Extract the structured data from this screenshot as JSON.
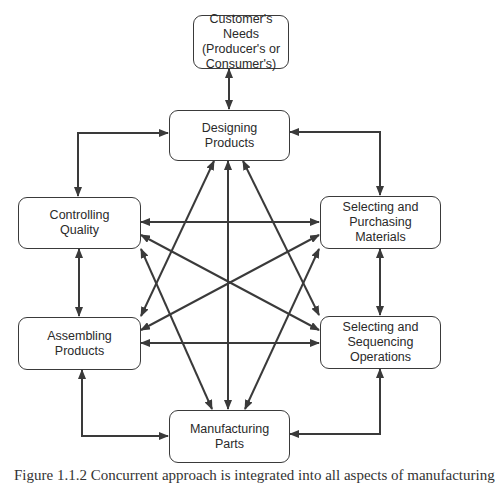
{
  "diagram": {
    "colors": {
      "line": "#3a3a3a",
      "box_border": "#3a3a3a",
      "text": "#2a2a2a",
      "background": "#ffffff"
    },
    "nodes": {
      "customers_needs": {
        "label": "Customer's Needs\n(Producer's or\nConsumer's)"
      },
      "designing_products": {
        "label": "Designing\nProducts"
      },
      "controlling_quality": {
        "label": "Controlling\nQuality"
      },
      "selecting_purchasing": {
        "label": "Selecting and\nPurchasing\nMaterials"
      },
      "assembling_products": {
        "label": "Assembling\nProducts"
      },
      "selecting_sequencing": {
        "label": "Selecting and\nSequencing\nOperations"
      },
      "manufacturing_parts": {
        "label": "Manufacturing\nParts"
      }
    },
    "edges": [
      {
        "from": "customers_needs",
        "to": "designing_products",
        "type": "bidirectional"
      },
      {
        "from": "designing_products",
        "to": "controlling_quality",
        "type": "bidirectional-elbow"
      },
      {
        "from": "designing_products",
        "to": "selecting_purchasing",
        "type": "bidirectional-elbow"
      },
      {
        "from": "designing_products",
        "to": "assembling_products",
        "type": "bidirectional"
      },
      {
        "from": "designing_products",
        "to": "manufacturing_parts",
        "type": "bidirectional"
      },
      {
        "from": "designing_products",
        "to": "selecting_sequencing",
        "type": "bidirectional"
      },
      {
        "from": "controlling_quality",
        "to": "selecting_purchasing",
        "type": "bidirectional"
      },
      {
        "from": "controlling_quality",
        "to": "selecting_sequencing",
        "type": "bidirectional"
      },
      {
        "from": "controlling_quality",
        "to": "manufacturing_parts",
        "type": "bidirectional"
      },
      {
        "from": "controlling_quality",
        "to": "assembling_products",
        "type": "bidirectional"
      },
      {
        "from": "selecting_purchasing",
        "to": "assembling_products",
        "type": "bidirectional"
      },
      {
        "from": "selecting_purchasing",
        "to": "manufacturing_parts",
        "type": "bidirectional"
      },
      {
        "from": "selecting_purchasing",
        "to": "selecting_sequencing",
        "type": "bidirectional"
      },
      {
        "from": "assembling_products",
        "to": "selecting_sequencing",
        "type": "bidirectional"
      },
      {
        "from": "assembling_products",
        "to": "manufacturing_parts",
        "type": "bidirectional-elbow"
      },
      {
        "from": "selecting_sequencing",
        "to": "manufacturing_parts",
        "type": "bidirectional-elbow"
      }
    ]
  },
  "caption": {
    "text": "Figure 1.1.2  Concurrent approach is integrated into all aspects of manufacturing"
  }
}
